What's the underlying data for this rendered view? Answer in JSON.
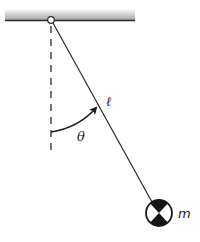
{
  "diagram": {
    "labels": {
      "length": "ℓ",
      "angle": "θ",
      "mass": "m"
    },
    "colors": {
      "line": "#2a2a2a",
      "ceiling_top": "#f2f2f2",
      "ceiling_bottom": "#a8a8a8",
      "bob_dark": "#151515",
      "bob_light": "#ffffff"
    },
    "geometry": {
      "pivot": [
        51,
        20
      ],
      "bob_center": [
        159,
        213
      ],
      "bob_radius": 13,
      "vertical_reference_end_y": 152
    }
  }
}
